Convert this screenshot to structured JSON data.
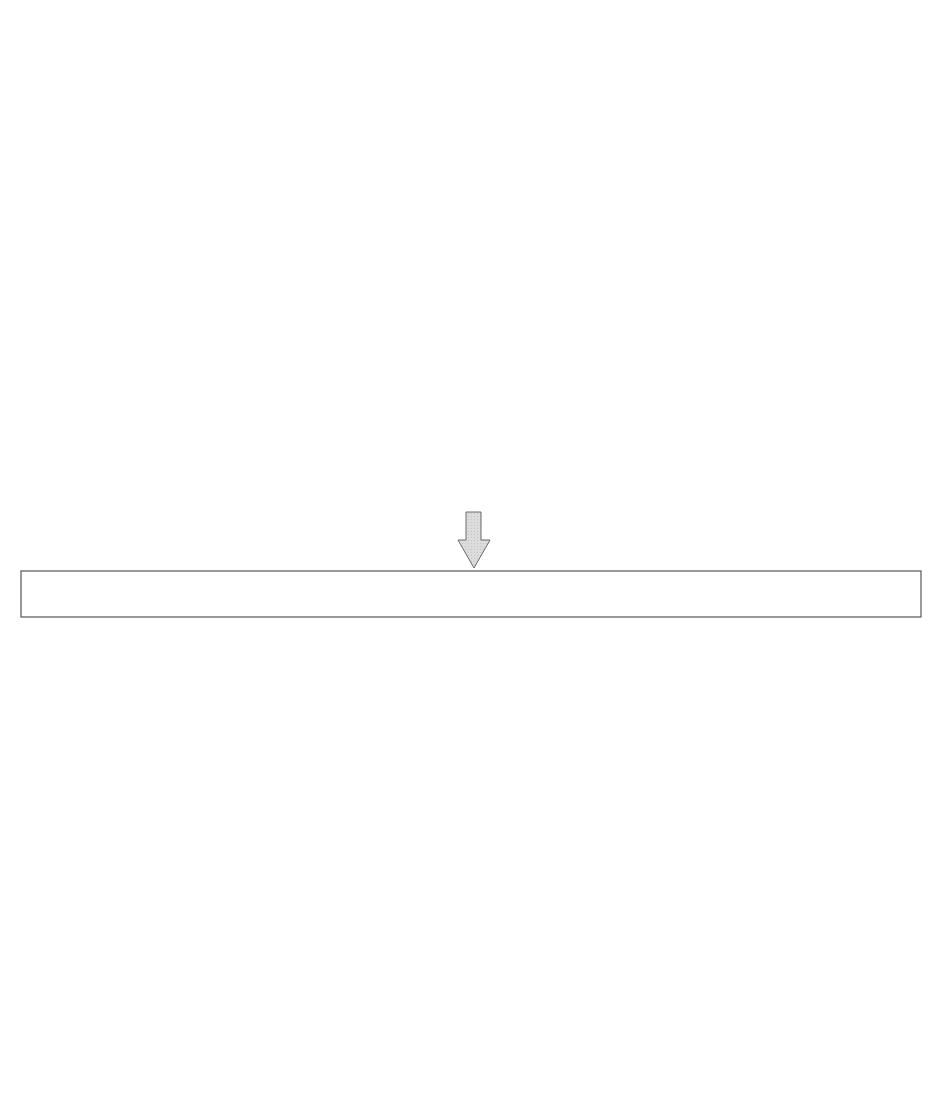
{
  "cycle": {
    "circles": [
      {
        "id": "determination",
        "label": "Determination",
        "cx": 478,
        "cy": 109,
        "r": 78
      },
      {
        "id": "education",
        "label": "Education",
        "cx": 336,
        "cy": 308,
        "r": 78
      },
      {
        "id": "implementation",
        "label": "Implementation",
        "cx": 616,
        "cy": 310,
        "r": 77
      }
    ],
    "arrow_labels": {
      "process": "Process",
      "problem": "Problem",
      "what": "What"
    },
    "fill_color": "#d9d9d9",
    "stroke_color": "#555555"
  },
  "notes": {
    "determination": {
      "intro": [
        "Only our activities can",
        "change our company"
      ],
      "bullets": [
        [
          "Recognize the need",
          "for transformation"
        ],
        [
          "Make the need clear",
          "to everyone"
        ],
        [
          "Reorganize"
        ]
      ]
    },
    "education": {
      "intro": [
        "Each employee understands",
        "his/her roles and responsibilities",
        "and acquires necessary knowledge and skills"
      ],
      "bullets": [
        [
          "Core executive and manager education"
        ],
        [
          "Education planning and implementation",
          "for each employee"
        ]
      ]
    },
    "implementation": {
      "intro": [
        "Make constant efforts step by step"
      ],
      "bullets": [
        [
          "Create a favorable environment",
          "(executives)"
        ],
        [
          "Be a leader and role model (managers)"
        ],
        [
          "Follow up education and training"
        ]
      ]
    }
  },
  "customer_box": {
    "label": "Customer (market)"
  },
  "side_labels": {
    "frontline": [
      "Frontline",
      "employees"
    ],
    "top_management": "Top management"
  },
  "node_letters": {
    "top": "D",
    "left": "E",
    "right": "I"
  },
  "left_pyramid": {
    "caption": [
      "Customer satisfaction awareness revolution",
      "and organization from top to bottom"
    ],
    "direction": "up",
    "rows": [
      {
        "y": 715,
        "xs": [
          85,
          155,
          225,
          295,
          365
        ]
      },
      {
        "y": 785,
        "xs": [
          130,
          193,
          257,
          318
        ]
      },
      {
        "y": 855,
        "xs": [
          193,
          257
        ]
      },
      {
        "y": 927,
        "xs": [
          225
        ]
      }
    ]
  },
  "right_pyramid": {
    "caption": [
      "Individual problem solving in an",
      "organized manner"
    ],
    "direction": "down",
    "rows": [
      {
        "y": 718,
        "xs": [
          580,
          648,
          718,
          786,
          855
        ]
      },
      {
        "y": 790,
        "xs": [
          623,
          688,
          749,
          813
        ]
      },
      {
        "y": 862,
        "xs": [
          685,
          746
        ]
      },
      {
        "y": 935,
        "xs": [
          717
        ]
      }
    ]
  },
  "colors": {
    "block_arrow": "#7a7a7a",
    "line": "#333333",
    "dashed": "#888888"
  }
}
